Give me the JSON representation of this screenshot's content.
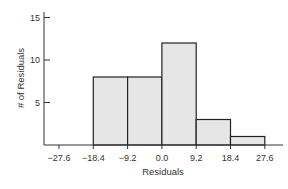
{
  "chart_data": {
    "type": "bar",
    "subtype": "histogram",
    "title": "",
    "xlabel": "Residuals",
    "ylabel": "# of Residuals",
    "x_ticks": [
      "-27.6",
      "-18.4",
      "-9.2",
      "0.0",
      "9.2",
      "18.4",
      "27.6"
    ],
    "y_ticks": [
      "5",
      "10",
      "15"
    ],
    "ylim": [
      0,
      15
    ],
    "xlim": [
      -27.6,
      27.6
    ],
    "bin_edges": [
      -27.6,
      -18.4,
      -9.2,
      0.0,
      9.2,
      18.4,
      27.6
    ],
    "categories": [
      "-27.6 to -18.4",
      "-18.4 to -9.2",
      "-9.2 to 0.0",
      "0.0 to 9.2",
      "9.2 to 18.4",
      "18.4 to 27.6"
    ],
    "values": [
      0,
      8,
      8,
      12,
      3,
      1
    ],
    "grid": false,
    "legend": null,
    "colors": {
      "bar_fill": "#e6e6e6",
      "bar_stroke": "#222222",
      "axis": "#333333"
    }
  }
}
